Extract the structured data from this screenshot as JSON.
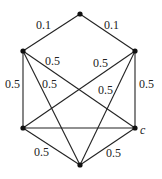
{
  "graph": {
    "nodes": [
      {
        "id": "top",
        "x": 80,
        "y": 14,
        "label": ""
      },
      {
        "id": "ul",
        "x": 23,
        "y": 51,
        "label": ""
      },
      {
        "id": "ur",
        "x": 135,
        "y": 51,
        "label": ""
      },
      {
        "id": "ll",
        "x": 23,
        "y": 128,
        "label": ""
      },
      {
        "id": "lr",
        "x": 135,
        "y": 128,
        "label": "c"
      },
      {
        "id": "bot",
        "x": 80,
        "y": 165,
        "label": ""
      }
    ],
    "edges": [
      {
        "from": "top",
        "to": "ul",
        "weight": "0.1"
      },
      {
        "from": "top",
        "to": "ur",
        "weight": "0.1"
      },
      {
        "from": "ul",
        "to": "ll",
        "weight": "0.5"
      },
      {
        "from": "ur",
        "to": "lr",
        "weight": "0.5"
      },
      {
        "from": "ll",
        "to": "bot",
        "weight": "0.5"
      },
      {
        "from": "lr",
        "to": "bot",
        "weight": "0.5"
      },
      {
        "from": "ul",
        "to": "lr",
        "weight": "0.5"
      },
      {
        "from": "ur",
        "to": "ll",
        "weight": "0.5"
      },
      {
        "from": "ul",
        "to": "bot",
        "weight": "0.5"
      },
      {
        "from": "ur",
        "to": "bot",
        "weight": "0.5"
      },
      {
        "from": "ll",
        "to": "lr",
        "weight": ""
      }
    ],
    "labels": {
      "e_top_ul": "0.1",
      "e_top_ur": "0.1",
      "e_ul_ll": "0.5",
      "e_ur_lr": "0.5",
      "e_ul_lr": "0.5",
      "e_ur_ll": "0.5",
      "e_ul_bot": "0.5",
      "e_ur_bot": "0.5",
      "e_ll_bot": "0.5",
      "e_lr_bot": "0.5",
      "node_c": "c"
    }
  }
}
